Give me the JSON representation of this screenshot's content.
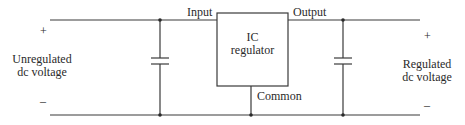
{
  "diagram": {
    "ic_label_line1": "IC",
    "ic_label_line2": "regulator",
    "pin_input": "Input",
    "pin_output": "Output",
    "pin_common": "Common",
    "left": {
      "plus": "+",
      "minus": "–",
      "line1": "Unregulated",
      "line2": "dc voltage"
    },
    "right": {
      "plus": "+",
      "minus": "–",
      "line1": "Regulated",
      "line2": "dc voltage"
    },
    "colors": {
      "wire": "#3a3a3a",
      "text": "#2a2a2a",
      "background": "#ffffff"
    }
  }
}
